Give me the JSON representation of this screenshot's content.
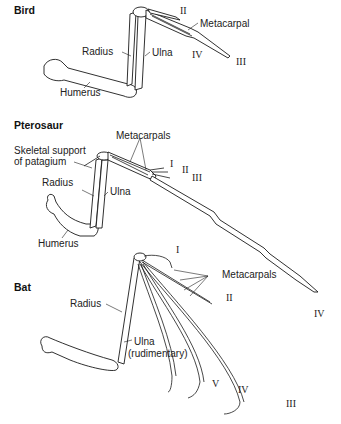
{
  "figure": {
    "panels": [
      {
        "title": "Bird",
        "labels": {
          "radius": "Radius",
          "ulna": "Ulna",
          "humerus": "Humerus",
          "metacarpal": "Metacarpal",
          "digit_ii": "II",
          "digit_iii": "III",
          "digit_iv": "IV"
        }
      },
      {
        "title": "Pterosaur",
        "labels": {
          "skeletal_support_line1": "Skeletal support",
          "skeletal_support_line2": "of patagium",
          "metacarpals": "Metacarpals",
          "radius": "Radius",
          "ulna": "Ulna",
          "humerus": "Humerus",
          "digit_i": "I",
          "digit_ii": "II",
          "digit_iii": "III",
          "digit_iv": "IV"
        }
      },
      {
        "title": "Bat",
        "labels": {
          "radius": "Radius",
          "ulna_line1": "Ulna",
          "ulna_line2": "(rudimentary)",
          "metacarpals": "Metacarpals",
          "digit_i": "I",
          "digit_ii": "II",
          "digit_iii": "III",
          "digit_iv": "IV",
          "digit_v": "V"
        }
      }
    ]
  }
}
